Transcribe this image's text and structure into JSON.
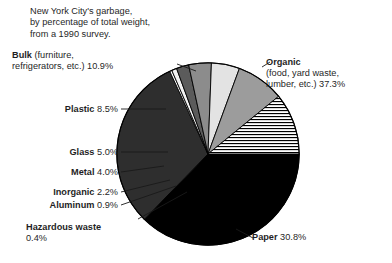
{
  "title": {
    "line1": "New York City's garbage,",
    "line2": "by percentage of total weight,",
    "line3": "from a 1990 survey."
  },
  "labels": {
    "organic": {
      "name": "Organic",
      "detail_line1": "(food, yard waste,",
      "detail_line2": "lumber, etc.) 37.3%"
    },
    "paper": {
      "name": "Paper",
      "value": "30.8%"
    },
    "bulk": {
      "name": "Bulk",
      "detail_line1": "(furniture,",
      "detail_line2": "refrigerators, etc.) 10.9%"
    },
    "plastic": {
      "name": "Plastic",
      "value": "8.5%"
    },
    "glass": {
      "name": "Glass",
      "value": "5.0%"
    },
    "metal": {
      "name": "Metal",
      "value": "4.0%"
    },
    "inorganic": {
      "name": "Inorganic",
      "value": "2.2%"
    },
    "aluminum": {
      "name": "Aluminum",
      "value": "0.9%"
    },
    "hazardous": {
      "name": "Hazardous waste",
      "value": "0.4%"
    }
  },
  "chart_data": {
    "type": "pie",
    "title": "New York City's garbage, by percentage of total weight, from a 1990 survey.",
    "unit": "percent of total weight",
    "start_angle_deg": 0,
    "direction": "clockwise",
    "categories": [
      "Organic",
      "Paper",
      "Hazardous waste",
      "Aluminum",
      "Inorganic",
      "Metal",
      "Glass",
      "Plastic",
      "Bulk"
    ],
    "values": [
      37.3,
      30.8,
      0.4,
      0.9,
      2.2,
      4.0,
      5.0,
      8.5,
      10.9
    ],
    "labels": [
      "Organic (food, yard waste, lumber, etc.) 37.3%",
      "Paper 30.8%",
      "Hazardous waste 0.4%",
      "Aluminum 0.9%",
      "Inorganic 2.2%",
      "Metal 4.0%",
      "Glass 5.0%",
      "Plastic 8.5%",
      "Bulk (furniture, refrigerators, etc.) 10.9%"
    ],
    "fills": [
      "#000000",
      "#2e2e2e",
      "#ffffff",
      "#f2f2f2",
      "#5b5b5b",
      "#8c8c8c",
      "#e3e3e3",
      "#9c9c9c",
      "hatch-horizontal"
    ],
    "colors": {
      "organic": "#000000",
      "paper": "#2e2e2e",
      "hazardous": "#ffffff",
      "aluminum": "#f2f2f2",
      "inorganic": "#5b5b5b",
      "metal": "#8c8c8c",
      "glass": "#e3e3e3",
      "plastic": "#9c9c9c",
      "bulk": "#ffffff",
      "outline": "#000000",
      "background": "#ffffff",
      "text": "#1f1f1f"
    },
    "legend": "none",
    "grid": false
  }
}
